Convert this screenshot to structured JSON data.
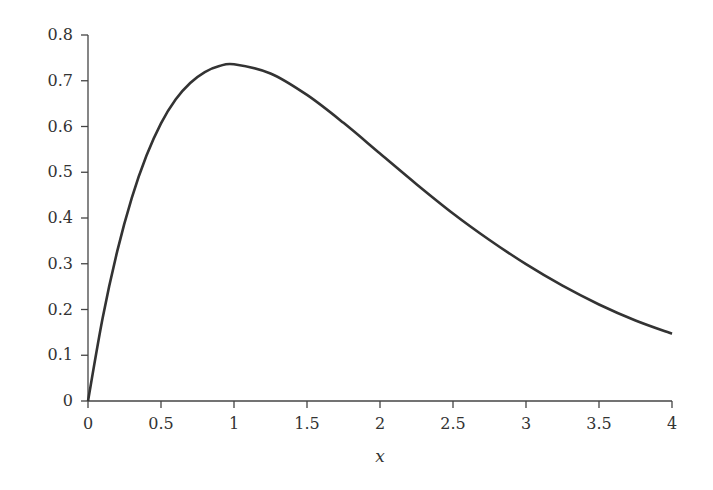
{
  "chart_data": {
    "type": "line",
    "title": "",
    "xlabel": "x",
    "ylabel": "",
    "xlim": [
      0,
      4
    ],
    "ylim": [
      0,
      0.8
    ],
    "grid": false,
    "legend": null,
    "x_ticks": [
      "0",
      "0.5",
      "1",
      "1.5",
      "2",
      "2.5",
      "3",
      "3.5",
      "4"
    ],
    "y_ticks": [
      "0",
      "0.1",
      "0.2",
      "0.3",
      "0.4",
      "0.5",
      "0.6",
      "0.7",
      "0.8"
    ],
    "series": [
      {
        "name": "f(x)",
        "color": "#333333",
        "x": [
          0,
          0.1,
          0.2,
          0.3,
          0.4,
          0.5,
          0.6,
          0.7,
          0.8,
          0.9,
          1.0,
          1.25,
          1.5,
          1.75,
          2.0,
          2.25,
          2.5,
          2.75,
          3.0,
          3.25,
          3.5,
          3.75,
          4.0
        ],
        "values": [
          0,
          0.181,
          0.327,
          0.444,
          0.536,
          0.607,
          0.659,
          0.695,
          0.719,
          0.732,
          0.736,
          0.716,
          0.669,
          0.608,
          0.541,
          0.474,
          0.41,
          0.352,
          0.299,
          0.252,
          0.211,
          0.176,
          0.147
        ]
      }
    ]
  }
}
